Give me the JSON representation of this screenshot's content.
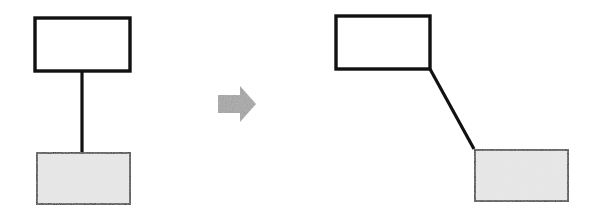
{
  "diagram": {
    "colors": {
      "stroke": "#111111",
      "empty_fill": "#ffffff",
      "shaded_fill": "#e6e6e6",
      "arrow_fill": "#8c8c8c",
      "background": "#ffffff"
    },
    "before": {
      "top_box": {
        "x": 35,
        "y": 18,
        "w": 95,
        "h": 53,
        "style": "empty"
      },
      "bottom_box": {
        "x": 36,
        "y": 152,
        "w": 95,
        "h": 53,
        "style": "shaded"
      },
      "connector": {
        "x1": 82,
        "y1": 71,
        "x2": 82,
        "y2": 152
      }
    },
    "transition_arrow": {
      "direction": "right",
      "icon": "arrow-right-icon"
    },
    "after": {
      "top_box": {
        "x": 336,
        "y": 16,
        "w": 94,
        "h": 53,
        "style": "empty"
      },
      "bottom_box": {
        "x": 474,
        "y": 149,
        "w": 95,
        "h": 53,
        "style": "shaded"
      },
      "connector": {
        "x1": 430,
        "y1": 69,
        "x2": 474,
        "y2": 149
      }
    }
  }
}
